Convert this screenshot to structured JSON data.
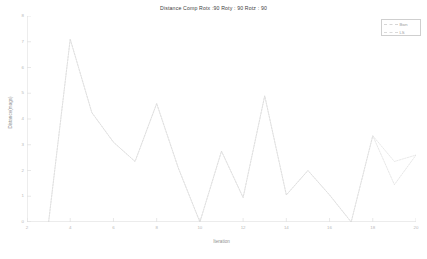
{
  "chart_data": {
    "type": "line",
    "title": "Distance Comp  Rotx :90 Roty : 90 Rotz : 90",
    "xlabel": "Iteration",
    "ylabel": "Distance(mags)",
    "xlim": [
      2,
      20
    ],
    "ylim": [
      0,
      8
    ],
    "grid": false,
    "legend_position": "top-right",
    "xticks": [
      2,
      4,
      6,
      8,
      10,
      12,
      14,
      16,
      18,
      20
    ],
    "xtick_labels": [
      "2",
      "4",
      "6",
      "8",
      "10",
      "12",
      "14",
      "16",
      "18",
      "20"
    ],
    "yticks": [
      0,
      1,
      2,
      3,
      4,
      5,
      6,
      7,
      8
    ],
    "ytick_labels": [
      "0",
      "1",
      "2",
      "3",
      "4",
      "5",
      "6",
      "7",
      "8"
    ],
    "x": [
      3,
      4,
      5,
      6,
      7,
      8,
      9,
      10,
      11,
      12,
      13,
      14,
      15,
      16,
      17,
      18,
      19,
      20
    ],
    "series": [
      {
        "name": "Bwn",
        "color": "#d6d6d6",
        "style": "dashed",
        "values": [
          0,
          7.1,
          4.25,
          3.1,
          2.35,
          4.6,
          2.1,
          0,
          2.75,
          0.95,
          4.9,
          1.05,
          2.0,
          1.05,
          0,
          3.35,
          1.45,
          2.6
        ]
      },
      {
        "name": "LS",
        "color": "#dadada",
        "style": "dashed",
        "values": [
          0,
          7.1,
          4.25,
          3.1,
          2.35,
          4.6,
          2.1,
          0,
          2.75,
          0.95,
          4.9,
          1.05,
          2.0,
          1.05,
          0,
          3.35,
          2.35,
          2.6
        ]
      }
    ]
  },
  "legend": {
    "items": [
      {
        "label": "Bwn",
        "color": "#d6d6d6"
      },
      {
        "label": "LS",
        "color": "#dadada"
      }
    ]
  }
}
